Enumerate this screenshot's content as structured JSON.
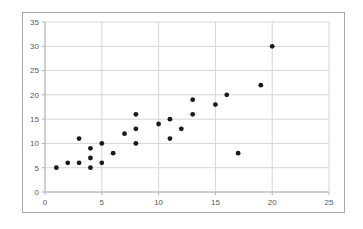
{
  "chart_data": {
    "type": "scatter",
    "title": "",
    "xlabel": "",
    "ylabel": "",
    "xlim": [
      0,
      25
    ],
    "ylim": [
      0,
      35
    ],
    "xticks": [
      0,
      5,
      10,
      15,
      20,
      25
    ],
    "yticks": [
      0,
      5,
      10,
      15,
      20,
      25,
      30,
      35
    ],
    "grid": true,
    "legend": null,
    "series": [
      {
        "name": "points",
        "points": [
          [
            1,
            5
          ],
          [
            2,
            6
          ],
          [
            3,
            6
          ],
          [
            3,
            11
          ],
          [
            4,
            5
          ],
          [
            4,
            7
          ],
          [
            4,
            9
          ],
          [
            5,
            6
          ],
          [
            5,
            10
          ],
          [
            6,
            8
          ],
          [
            7,
            12
          ],
          [
            8,
            10
          ],
          [
            8,
            13
          ],
          [
            8,
            16
          ],
          [
            10,
            14
          ],
          [
            11,
            11
          ],
          [
            11,
            15
          ],
          [
            12,
            13
          ],
          [
            13,
            16
          ],
          [
            13,
            19
          ],
          [
            15,
            18
          ],
          [
            16,
            20
          ],
          [
            17,
            8
          ],
          [
            19,
            22
          ],
          [
            20,
            30
          ]
        ]
      }
    ],
    "marker": {
      "shape": "circle",
      "color": "#1a1a1a",
      "radius_px": 2.4
    }
  },
  "style": {
    "background": "#ffffff",
    "frame_border": "#a9a9a9",
    "gridline": "#d6d6d6",
    "axis_line": "#b3b3b3",
    "tick_color": "#b3b3b3",
    "tick_label_color": "#595959",
    "tick_font_size_px": 8
  }
}
